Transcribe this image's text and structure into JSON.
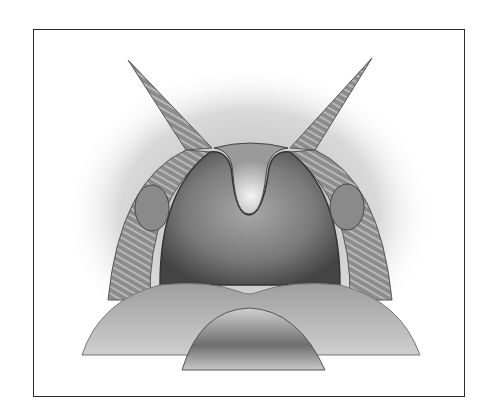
{
  "figure": {
    "parts": [
      "soft-palate",
      "uvula",
      "palatoglossal-arch-left",
      "palatoglossal-arch-right",
      "palatine-tonsil-left",
      "palatine-tonsil-right",
      "posterior-pharyngeal-wall",
      "tongue",
      "tongue-tip"
    ],
    "palette": {
      "background": "#ffffff",
      "frame": "#2a2a2a",
      "tissue_light": "#d8d8d8",
      "tissue_mid": "#9a9a9a",
      "tissue_dark": "#555555"
    }
  }
}
